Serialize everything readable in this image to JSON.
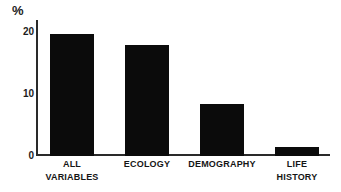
{
  "chart_data": {
    "type": "bar",
    "title": "",
    "subtitle": "",
    "xlabel": "",
    "ylabel": "%",
    "unit_label": "%",
    "categories": [
      "ALL VARIABLES",
      "ECOLOGY",
      "DEMOGRAPHY",
      "LIFE HISTORY"
    ],
    "category_lines": [
      [
        "ALL",
        "VARIABLES"
      ],
      [
        "ECOLOGY",
        ""
      ],
      [
        "DEMOGRAPHY",
        ""
      ],
      [
        "LIFE",
        "HISTORY"
      ]
    ],
    "values": [
      19.7,
      18.0,
      8.4,
      1.5
    ],
    "ylim": [
      0,
      22
    ],
    "yticks": [
      0,
      10,
      20
    ],
    "ytick_labels": [
      "0",
      "10",
      "20"
    ],
    "grid": false,
    "legend": false,
    "legend_position": "none",
    "bar_color": "#0b0b0b",
    "axis_color": "#2a2a2a",
    "background_color": "#ffffff"
  }
}
